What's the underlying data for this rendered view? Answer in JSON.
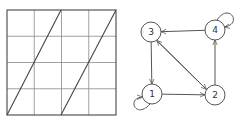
{
  "colors": {
    "background": "#ffffff",
    "grid_line": "#8a8a8a",
    "grid_border": "#555555",
    "diagonal": "#444444",
    "graph_stroke": "#555555"
  },
  "grid": {
    "left": 7,
    "top": 10,
    "right": 116,
    "bottom": 115,
    "rows": 4,
    "cols": 4,
    "diagonals": [
      {
        "x1": 7,
        "y1": 115,
        "x2": 61,
        "y2": 10
      },
      {
        "x1": 61,
        "y1": 115,
        "x2": 116,
        "y2": 10
      }
    ]
  },
  "graph": {
    "nodes": [
      {
        "id": "1",
        "label": "1",
        "cx": 152,
        "cy": 94,
        "r": 10
      },
      {
        "id": "2",
        "label": "2",
        "cx": 215,
        "cy": 95,
        "r": 10
      },
      {
        "id": "3",
        "label": "3",
        "cx": 151,
        "cy": 32,
        "r": 10
      },
      {
        "id": "4",
        "label": "4",
        "cx": 215,
        "cy": 30,
        "r": 10
      }
    ],
    "edges": [
      {
        "from": "3",
        "to": "1"
      },
      {
        "from": "1",
        "to": "2"
      },
      {
        "from": "2",
        "to": "4"
      },
      {
        "from": "4",
        "to": "3"
      },
      {
        "from": "3",
        "to": "2"
      },
      {
        "from": "2",
        "to": "3"
      },
      {
        "from": "1",
        "to": "1",
        "loop": "lower-left"
      },
      {
        "from": "4",
        "to": "4",
        "loop": "upper-right"
      }
    ]
  }
}
